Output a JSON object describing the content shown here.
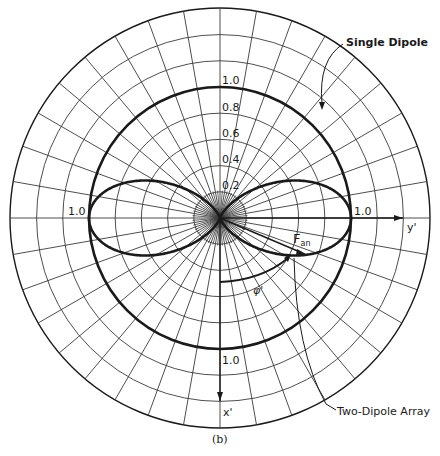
{
  "figure": {
    "caption": "(b)",
    "center": [
      220,
      218
    ],
    "outer_radius": 210,
    "unit_radius": 131,
    "ring_step_value": 0.2,
    "spoke_step_deg": 10,
    "colors": {
      "ink": "#1a1a1a",
      "grid": "#3a3a3a",
      "background": "#ffffff"
    }
  },
  "labels": {
    "single_dipole": "Single Dipole",
    "two_dipole_array": "Two-Dipole Array",
    "f_an_main": "F",
    "f_an_sub": "an",
    "phi_prime": "φ'",
    "x_prime": "x'",
    "y_prime": "y'"
  },
  "ticks": {
    "vertical": [
      "1.0",
      "0.8",
      "0.6",
      "0.4",
      "0.2"
    ],
    "left": "1.0",
    "right": "1.0",
    "bottom": "1.0"
  },
  "chart_data": {
    "type": "polar",
    "title": "",
    "axes": {
      "reference_up": "none",
      "x_axis": "x' (down)",
      "y_axis": "y' (right)"
    },
    "radial_ticks": [
      0.2,
      0.4,
      0.6,
      0.8,
      1.0
    ],
    "series": [
      {
        "name": "Single Dipole",
        "shape": "circle",
        "radius": 1.0
      },
      {
        "name": "Two-Dipole Array",
        "shape": "figure-eight along y'",
        "max": 1.0,
        "nulls_at_deg": [
          0,
          180
        ],
        "peaks_at_deg": [
          90,
          270
        ]
      }
    ],
    "annotations": [
      "F_an",
      "φ'",
      "(b)"
    ]
  }
}
